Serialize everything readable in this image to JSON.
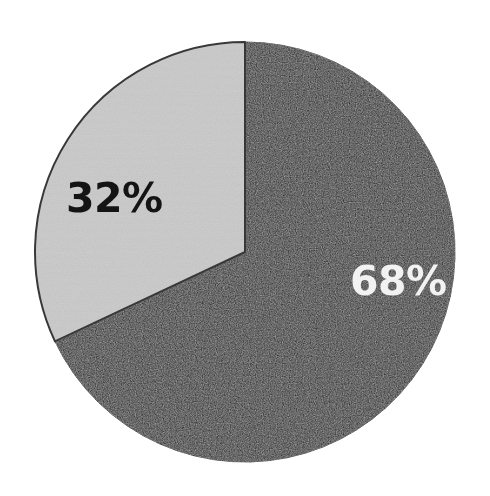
{
  "chart_data": {
    "type": "pie",
    "title": "",
    "subtitle": "",
    "xlabel": "",
    "ylabel": "",
    "grid": false,
    "legend_position": "none",
    "units": "percent",
    "total": 100,
    "start_angle_deg": 0,
    "direction": "clockwise",
    "background_color": "#ffffff",
    "outline_color": "#2b2b2b",
    "categories": [
      "68%",
      "32%"
    ],
    "values": [
      68,
      32
    ],
    "slices": [
      {
        "label": "68%",
        "value": 68,
        "color": "#1a1a1a",
        "label_color": "#f2f2f2",
        "start_angle_deg": 0,
        "end_angle_deg": 244.8
      },
      {
        "label": "32%",
        "value": 32,
        "color": "#cdcdcd",
        "label_color": "#141414",
        "start_angle_deg": 244.8,
        "end_angle_deg": 360
      }
    ],
    "annotations": [
      "68%",
      "32%"
    ]
  },
  "figure": {
    "labels": {
      "dark_slice": "68%",
      "gray_slice": "32%"
    }
  }
}
